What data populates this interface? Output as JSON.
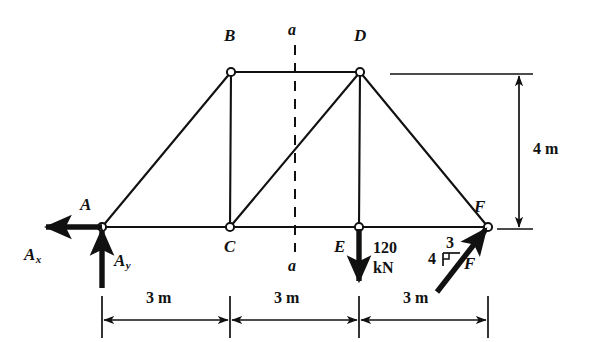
{
  "figure": {
    "stroke_color": "#111111",
    "background": "#ffffff"
  },
  "joints": [
    {
      "id": "A",
      "label": "A",
      "x": 102,
      "y": 227
    },
    {
      "id": "B",
      "label": "B",
      "x": 231,
      "y": 72
    },
    {
      "id": "C",
      "label": "C",
      "x": 230,
      "y": 227
    },
    {
      "id": "D",
      "label": "D",
      "x": 360,
      "y": 72
    },
    {
      "id": "E",
      "label": "E",
      "x": 359,
      "y": 227
    },
    {
      "id": "F",
      "label": "F",
      "x": 488,
      "y": 227
    }
  ],
  "members": [
    {
      "from": "A",
      "to": "B"
    },
    {
      "from": "A",
      "to": "C"
    },
    {
      "from": "B",
      "to": "C"
    },
    {
      "from": "B",
      "to": "D"
    },
    {
      "from": "C",
      "to": "D"
    },
    {
      "from": "C",
      "to": "E"
    },
    {
      "from": "D",
      "to": "E"
    },
    {
      "from": "D",
      "to": "F"
    },
    {
      "from": "E",
      "to": "F"
    }
  ],
  "section": {
    "label_top": "a",
    "label_bottom": "a",
    "x": 295,
    "y_top": 45,
    "y_bottom": 252,
    "style": "dashed"
  },
  "reactions": {
    "ax": {
      "label": "A",
      "sub": "x",
      "direction": "left",
      "at_joint": "A"
    },
    "ay": {
      "label": "A",
      "sub": "y",
      "direction": "up",
      "at_joint": "A"
    }
  },
  "loads": [
    {
      "id": "load-E",
      "at_joint": "E",
      "magnitude": "120",
      "unit": "kN",
      "direction": "down"
    },
    {
      "id": "load-F",
      "at_joint": "F",
      "label": "F",
      "direction": "up-right",
      "slope_rise": "3",
      "slope_run": "4"
    }
  ],
  "dimensions": {
    "horizontal": [
      {
        "label": "3 m",
        "from": "A",
        "to": "C"
      },
      {
        "label": "3 m",
        "from": "C",
        "to": "E"
      },
      {
        "label": "3 m",
        "from": "E",
        "to": "F"
      }
    ],
    "vertical": [
      {
        "label": "4 m",
        "from": "top-chord",
        "to": "bottom-chord"
      }
    ]
  }
}
